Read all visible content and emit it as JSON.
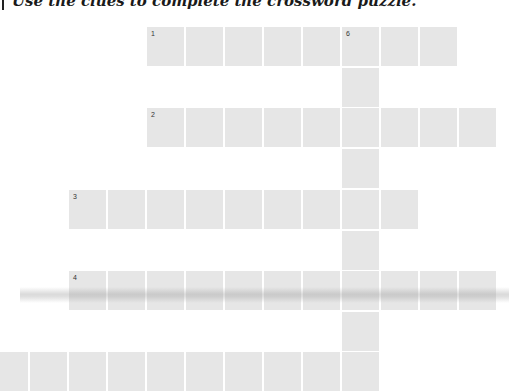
{
  "instruction": {
    "text": "Use the clues to complete the crossword puzzle."
  },
  "grid": {
    "col_origin_x": 69,
    "col_pitch": 39,
    "row_y": [
      27,
      68,
      108,
      149,
      190,
      231,
      271,
      312,
      352
    ],
    "cell_color": "#e6e6e6",
    "rows": [
      {
        "row": 0,
        "cols": [
          2,
          3,
          4,
          5,
          6,
          7,
          8,
          9
        ],
        "numbers": {
          "2": "1",
          "7": "6"
        }
      },
      {
        "row": 1,
        "cols": [
          7
        ],
        "numbers": {}
      },
      {
        "row": 2,
        "cols": [
          2,
          3,
          4,
          5,
          6,
          7,
          8,
          9,
          10
        ],
        "numbers": {
          "2": "2"
        }
      },
      {
        "row": 3,
        "cols": [
          7
        ],
        "numbers": {}
      },
      {
        "row": 4,
        "cols": [
          0,
          1,
          2,
          3,
          4,
          5,
          6,
          7,
          8
        ],
        "numbers": {
          "0": "3"
        }
      },
      {
        "row": 5,
        "cols": [
          7
        ],
        "numbers": {}
      },
      {
        "row": 6,
        "cols": [
          0,
          1,
          2,
          3,
          4,
          5,
          6,
          7,
          8,
          9,
          10
        ],
        "numbers": {
          "0": "4"
        }
      },
      {
        "row": 7,
        "cols": [
          7
        ],
        "numbers": {}
      },
      {
        "row": 8,
        "cols": [
          -2,
          -1,
          0,
          1,
          2,
          3,
          4,
          5,
          6,
          7
        ],
        "numbers": {}
      }
    ]
  },
  "clue_numbers": [
    "1",
    "2",
    "3",
    "4",
    "6"
  ]
}
